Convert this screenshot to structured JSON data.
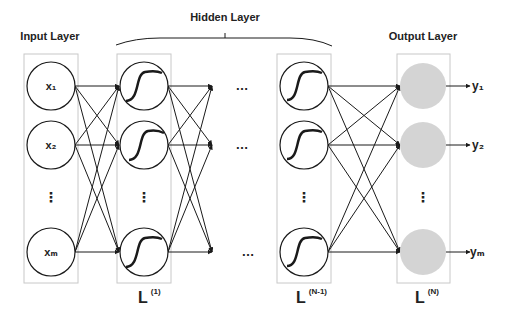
{
  "title_labels": {
    "input_layer": "Input Layer",
    "hidden_layer": "Hidden Layer",
    "output_layer": "Output Layer"
  },
  "inputs": [
    "x₁",
    "x₂",
    "⋮",
    "xₘ"
  ],
  "outputs": [
    "y₁",
    "y₂",
    "⋮",
    "yₘ"
  ],
  "layer_labels": {
    "first": {
      "base": "L",
      "sup": "(1)"
    },
    "penultimate": {
      "base": "L",
      "sup": "(N-1)"
    },
    "last": {
      "base": "L",
      "sup": "(N)"
    }
  },
  "ellipsis": "…",
  "vertical_ellipsis": "⋮",
  "node_types": {
    "input": "plain-circle",
    "hidden": "sigmoid-activation-circle",
    "output": "gray-filled-circle"
  },
  "colors": {
    "stroke": "#1a1a1a",
    "box_border": "#c8c8c8",
    "output_fill": "#d4d4d4"
  }
}
